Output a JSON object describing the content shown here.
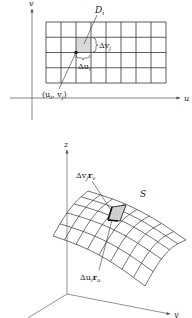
{
  "top_figure": {
    "axes": {
      "u_label": "u",
      "v_label": "v",
      "origin": [
        32,
        98
      ],
      "u_end": [
        182,
        98
      ],
      "v_end": [
        32,
        6
      ]
    },
    "grid": {
      "x0": 46,
      "y0": 22,
      "cols": 8,
      "rows": 4,
      "cell_w": 15,
      "cell_h": 15.25,
      "line_color": "#333333"
    },
    "region": {
      "label": "D",
      "label_sub": "i",
      "shaded_cell": {
        "col": 2,
        "row": 1
      },
      "fill": "#d9d9d9"
    },
    "point": {
      "label": "(u",
      "label_sub1": "i",
      "label_mid": ", v",
      "label_sub2": "j",
      "label_end": ")"
    },
    "delta_v": {
      "label": "Δv",
      "sub": "j"
    },
    "delta_u": {
      "label": "Δu",
      "sub": "i"
    }
  },
  "bottom_figure": {
    "axes": {
      "x_label": "x",
      "y_label": "y",
      "z_label": "z",
      "origin": [
        67,
        294
      ]
    },
    "surface": {
      "label": "S",
      "corners": {
        "far_left": [
          88,
          191
        ],
        "far_right": [
          186,
          240
        ],
        "near_right": [
          145,
          286
        ],
        "near_left": [
          53,
          236
        ]
      },
      "cols": 8,
      "rows": 5,
      "line_color": "#333333"
    },
    "patch": {
      "fill": "#cfcfcf"
    },
    "vector_v": {
      "label": "Δv",
      "sub": "j",
      "vec": "r",
      "vec_sub": "v"
    },
    "vector_u": {
      "label": "Δu",
      "sub": "i",
      "vec": "r",
      "vec_sub": "u"
    }
  }
}
